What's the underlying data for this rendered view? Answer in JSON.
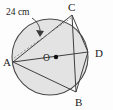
{
  "figure": {
    "type": "circle-geometry-diagram",
    "background_color": "#fdfdfd",
    "circle": {
      "center_label": "O",
      "center_x": 50,
      "center_y": 57,
      "radius": 38,
      "fill_color": "#e3e3e3",
      "stroke_color": "#4a4a4a",
      "stroke_width": 1.1
    },
    "points": [
      {
        "label": "A",
        "x": 13,
        "y": 62,
        "label_x": 3,
        "label_y": 66
      },
      {
        "label": "B",
        "x": 76,
        "y": 92,
        "label_x": 76,
        "label_y": 106
      },
      {
        "label": "C",
        "x": 72,
        "y": 15,
        "label_x": 69,
        "label_y": 11
      },
      {
        "label": "D",
        "x": 88,
        "y": 52,
        "label_x": 95,
        "label_y": 57
      }
    ],
    "center_point": {
      "label": "O",
      "x": 50,
      "y": 57,
      "dot_x": 56,
      "dot_y": 57,
      "dot_radius": 2.2,
      "label_x": 43,
      "label_y": 61
    },
    "chords": [
      {
        "from": "A",
        "to": "C",
        "style": "solid",
        "x1": 13,
        "y1": 62,
        "x2": 72,
        "y2": 15
      },
      {
        "from": "A",
        "to": "D",
        "style": "solid",
        "x1": 13,
        "y1": 62,
        "x2": 88,
        "y2": 52
      },
      {
        "from": "A",
        "to": "B",
        "style": "solid",
        "x1": 13,
        "y1": 62,
        "x2": 76,
        "y2": 92
      },
      {
        "from": "C",
        "to": "B",
        "style": "solid",
        "x1": 72,
        "y1": 15,
        "x2": 76,
        "y2": 92
      },
      {
        "from": "C",
        "to": "D",
        "style": "solid",
        "x1": 72,
        "y1": 15,
        "x2": 88,
        "y2": 52
      },
      {
        "from": "D",
        "to": "B",
        "style": "solid",
        "x1": 88,
        "y1": 52,
        "x2": 76,
        "y2": 92
      },
      {
        "from": "A",
        "to": "C",
        "style": "dashed",
        "x1": 14,
        "y1": 58,
        "x2": 71,
        "y2": 18
      }
    ],
    "measurement": {
      "value": "24 cm",
      "label_x": 6,
      "label_y": 15,
      "leader_path": "M 32 18 C 38 22, 41 28, 40 35",
      "arrow_tip_x": 40,
      "arrow_tip_y": 36,
      "arrow_points": "40,37 36,30 44,31"
    },
    "stroke_colors": {
      "chord": "#3f3f3f",
      "dashed_chord": "#8b8b8b",
      "leader": "#3a3a3a"
    }
  }
}
